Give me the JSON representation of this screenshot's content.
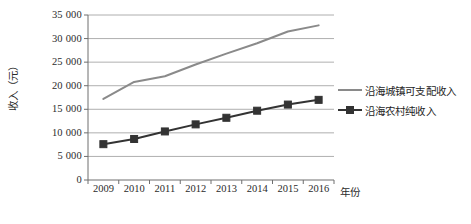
{
  "chart_data": {
    "type": "line",
    "title": "",
    "xlabel": "年份",
    "ylabel": "收入（元）",
    "categories": [
      "2009",
      "2010",
      "2011",
      "2012",
      "2013",
      "2014",
      "2015",
      "2016"
    ],
    "ylim": [
      0,
      35000
    ],
    "ytick_step": 5000,
    "yticks": [
      "0",
      "5 000",
      "10 000",
      "15 000",
      "20 000",
      "25 000",
      "30 000",
      "35 000"
    ],
    "ytick_values": [
      0,
      5000,
      10000,
      15000,
      20000,
      25000,
      30000,
      35000
    ],
    "grid": "horizontal",
    "legend_position": "right",
    "series": [
      {
        "name": "沿海城镇可支配收入",
        "color": "#8a8a8a",
        "marker": "none",
        "line_width": 2.0,
        "values": [
          17200,
          20800,
          22000,
          24500,
          26800,
          29000,
          31500,
          32800
        ]
      },
      {
        "name": "沿海农村纯收入",
        "color": "#333333",
        "marker": "square",
        "line_width": 2.0,
        "values": [
          7600,
          8700,
          10300,
          11800,
          13200,
          14700,
          16000,
          17000
        ]
      }
    ]
  },
  "axes": {
    "plot_left": 88,
    "plot_right": 334,
    "plot_top": 15,
    "plot_bottom": 180
  },
  "colors": {
    "urban_line": "#8a8a8a",
    "rural_line": "#333333",
    "gridline": "#9a9a9a",
    "axis": "#6e6e6e",
    "text": "#2b2b2b",
    "background": "#ffffff"
  }
}
